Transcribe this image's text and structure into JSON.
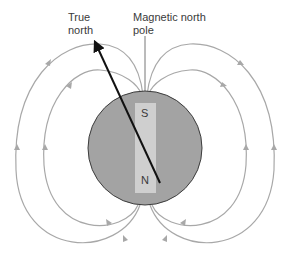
{
  "diagram": {
    "labels": {
      "true_north": "True\nnorth",
      "magnetic_north_pole": "Magnetic north\npole"
    },
    "magnet": {
      "south_label": "S",
      "north_label": "N"
    },
    "colors": {
      "earth_fill": "#a3a3a3",
      "earth_stroke": "#3c3c3c",
      "magnet_fill": "#cfcfcf",
      "field_line": "#a8a8a8",
      "axis_arrow": "#111111",
      "text": "#3a3a3a"
    },
    "icons": {
      "axis_arrow": "arrow-up-left-icon",
      "field_arrows": "triangle-arrow-icon"
    }
  }
}
